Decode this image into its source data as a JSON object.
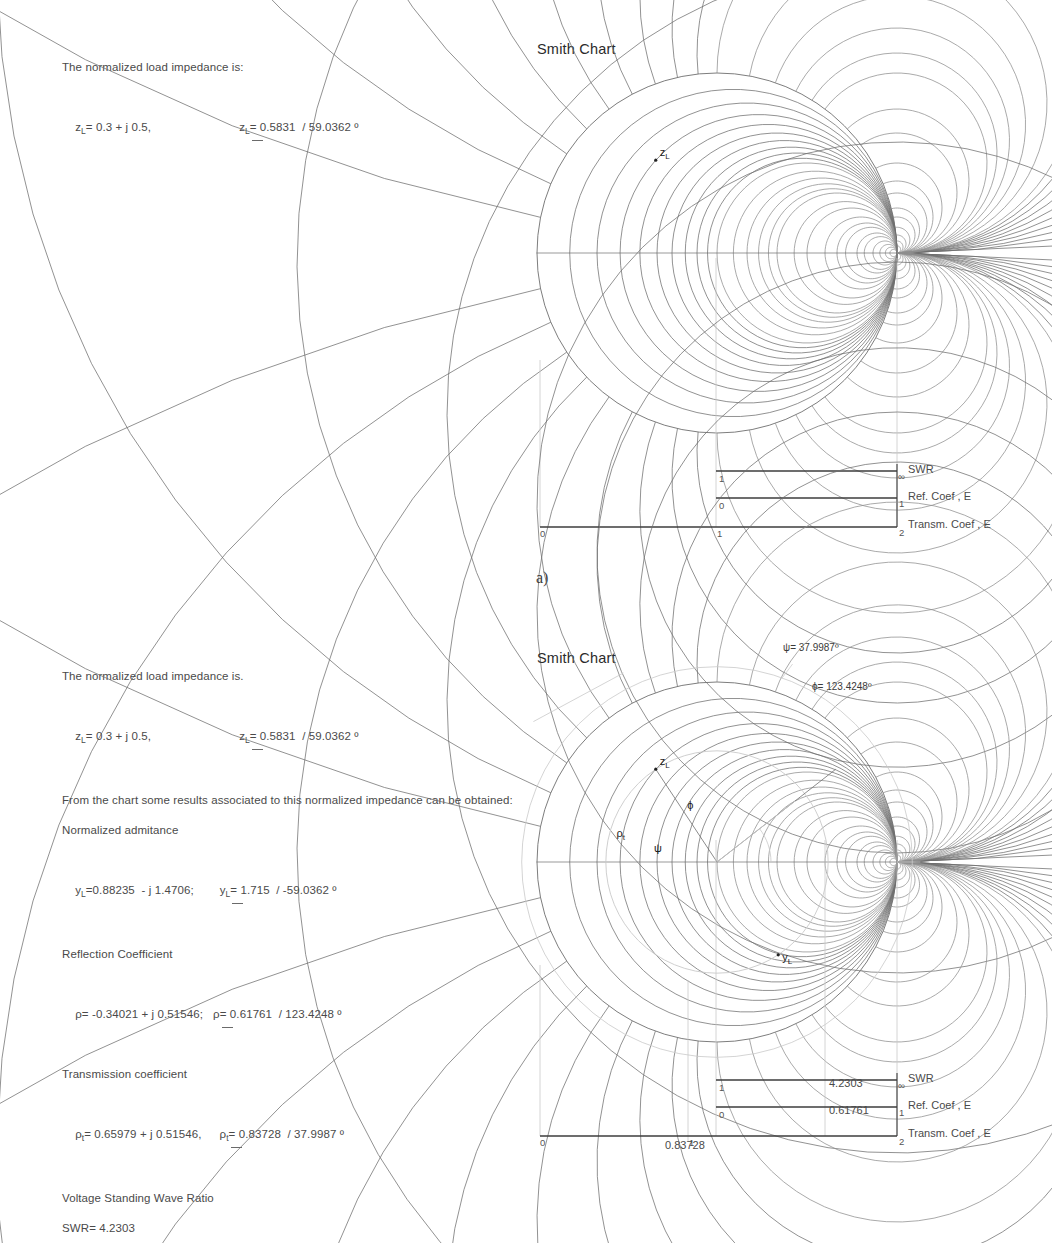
{
  "page": {
    "panel_a_label": "a)"
  },
  "panel_a": {
    "text": {
      "line1": "The normalized load impedance is:",
      "zl_rect": "z",
      "zl_rect_sub": "L",
      "zl_rect_val": "= 0.3 + j 0.5,",
      "zl_pol": "z",
      "zl_pol_sub": "L",
      "zl_pol_val_pre": "= 0.5831  /",
      "zl_pol_val_post": " 59.0362 º"
    },
    "chart": {
      "title": "Smith Chart",
      "marker_zl": "z",
      "marker_zl_sub": "L"
    },
    "scales": {
      "swr_label": "SWR",
      "ref_label": "Ref. Coef , E",
      "transm_label": "Transm. Coef , E",
      "swr_left": "1",
      "swr_right": "∞",
      "ref_left": "0",
      "ref_right": "1",
      "transm_right": "2",
      "axis_0": "0",
      "axis_1": "1",
      "swr_value": "",
      "ref_value": "",
      "transm_value": ""
    }
  },
  "panel_b": {
    "text": {
      "line1": "The normalized load impedance is.",
      "zl_rect": "z",
      "zl_rect_sub": "L",
      "zl_rect_val": "= 0.3 + j 0.5,",
      "zl_pol": "z",
      "zl_pol_sub": "L",
      "zl_pol_val_pre": "= 0.5831  /",
      "zl_pol_val_post": " 59.0362 º",
      "line_from_chart": "From the chart some results associated to this normalized impedance can be obtained:",
      "head_admittance": "Normalized admitance",
      "yl_rect": "y",
      "yl_rect_sub": "L",
      "yl_rect_val": "=0.88235  - j 1.4706;",
      "yl_pol": "y",
      "yl_pol_sub": "L",
      "yl_pol_val_pre": "= 1.715  /",
      "yl_pol_val_post": " -59.0362 º",
      "head_reflection": "Reflection Coefficient",
      "rho_rect": "ρ",
      "rho_rect_val": "= -0.34021 + j 0.51546;",
      "rho_pol": "ρ",
      "rho_pol_val_pre": "= 0.61761  /",
      "rho_pol_val_post": " 123.4248 º",
      "head_transmission": "Transmission coefficient",
      "rhot_rect": "ρ",
      "rhot_rect_sub": "t",
      "rhot_rect_val": "= 0.65979 + j 0.51546,",
      "rhot_pol": "ρ",
      "rhot_pol_sub": "t",
      "rhot_pol_val_pre": "= 0.83728  /",
      "rhot_pol_val_post": " 37.9987 º",
      "head_vswr": "Voltage Standing Wave Ratio",
      "swr_line": "SWR= 4.2303"
    },
    "chart": {
      "title": "Smith Chart",
      "psi_annotation": "ψ= 37.9987º",
      "phi_annotation": "ϕ= 123.4248º",
      "marker_zl": "z",
      "marker_zl_sub": "L",
      "marker_yl": "y",
      "marker_yl_sub": "L",
      "marker_rhot": "ρ",
      "marker_rhot_sub": "t",
      "marker_phi": "ϕ",
      "marker_psi": "ψ"
    },
    "scales": {
      "swr_label": "SWR",
      "ref_label": "Ref. Coef , E",
      "transm_label": "Transm. Coef , E",
      "swr_left": "1",
      "swr_right": "∞",
      "ref_left": "0",
      "ref_right": "1",
      "transm_right": "2",
      "axis_0": "0",
      "axis_1": "1",
      "swr_value": "4.2303",
      "ref_value": "0.61761",
      "transm_value": "0.83728"
    }
  },
  "chart_data": {
    "type": "smith-chart",
    "title": "Smith Chart",
    "panels": [
      {
        "id": "a",
        "center_px": [
          717,
          253
        ],
        "radius_px": 180,
        "resistance_circles": [
          0.1,
          0.2,
          0.3,
          0.4,
          0.5,
          0.6,
          0.7,
          0.8,
          0.9,
          1.0,
          1.2,
          1.4,
          1.6,
          1.8,
          2.0,
          2.5,
          3.0,
          4.0,
          5.0,
          6.0,
          8.0,
          10.0,
          14.0,
          20.0,
          30.0,
          50.0
        ],
        "reactance_arcs": [
          0.1,
          0.2,
          0.3,
          0.4,
          0.5,
          0.6,
          0.7,
          0.8,
          0.9,
          1.0,
          1.2,
          1.4,
          1.6,
          1.8,
          2.0,
          2.5,
          3.0,
          4.0,
          5.0,
          6.0,
          8.0,
          10.0,
          14.0,
          20.0,
          30.0,
          50.0
        ],
        "points": [
          {
            "name": "z_L",
            "r": 0.3,
            "x": 0.5,
            "gamma_mag": 0.61761,
            "gamma_deg": 123.4248,
            "label": "zL"
          }
        ],
        "swr_circle": false,
        "vectors": []
      },
      {
        "id": "b",
        "center_px": [
          717,
          862
        ],
        "radius_px": 180,
        "resistance_circles": [
          0.1,
          0.2,
          0.3,
          0.4,
          0.5,
          0.6,
          0.7,
          0.8,
          0.9,
          1.0,
          1.2,
          1.4,
          1.6,
          1.8,
          2.0,
          2.5,
          3.0,
          4.0,
          5.0,
          6.0,
          8.0,
          10.0,
          14.0,
          20.0,
          30.0,
          50.0
        ],
        "reactance_arcs": [
          0.1,
          0.2,
          0.3,
          0.4,
          0.5,
          0.6,
          0.7,
          0.8,
          0.9,
          1.0,
          1.2,
          1.4,
          1.6,
          1.8,
          2.0,
          2.5,
          3.0,
          4.0,
          5.0,
          6.0,
          8.0,
          10.0,
          14.0,
          20.0,
          30.0,
          50.0
        ],
        "points": [
          {
            "name": "z_L",
            "r": 0.3,
            "x": 0.5,
            "gamma_mag": 0.61761,
            "gamma_deg": 123.4248,
            "label": "zL"
          },
          {
            "name": "y_L",
            "r": 0.88235,
            "x": -1.4706,
            "gamma_mag": 0.61761,
            "gamma_deg": -56.5752,
            "label": "yL"
          }
        ],
        "swr_circle": true,
        "swr_circle_radius_norm": 0.61761,
        "vectors": [
          {
            "name": "rho",
            "mag": 0.61761,
            "deg": 123.4248
          },
          {
            "name": "rho_t",
            "mag": 0.83728,
            "deg": 37.9987
          }
        ],
        "angles": [
          {
            "symbol": "ψ",
            "deg": 37.9987
          },
          {
            "symbol": "ϕ",
            "deg": 123.4248
          }
        ]
      }
    ],
    "scales": {
      "rows": [
        "SWR",
        "Ref. Coef , E",
        "Transm. Coef , E"
      ],
      "swr_range": [
        "1",
        "∞"
      ],
      "ref_range": [
        "0",
        "1"
      ],
      "transm_range": [
        "0",
        "2"
      ],
      "panel_b_values": {
        "SWR": 4.2303,
        "Ref. Coef , E": 0.61761,
        "Transm. Coef , E": 0.83728
      }
    }
  }
}
